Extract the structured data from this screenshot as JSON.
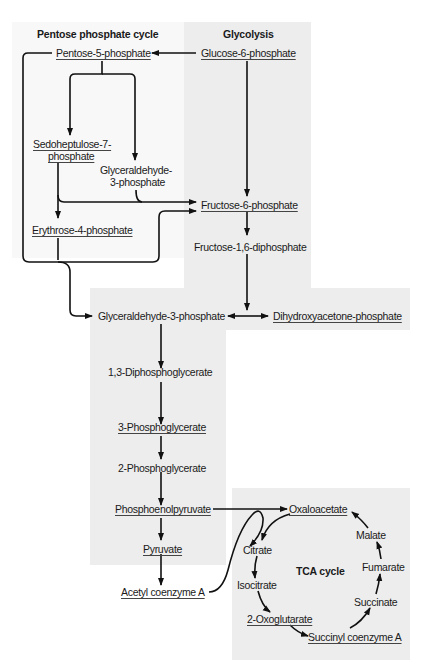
{
  "diagram": {
    "regions": {
      "pentose": {
        "title": "Pentose phosphate cycle",
        "fill": "#f8f8f8"
      },
      "glycolysis": {
        "title": "Glycolysis",
        "fill": "#ededed"
      },
      "tca": {
        "title": "TCA cycle",
        "fill": "#ededed"
      }
    },
    "nodes": {
      "pentose_5_phosphate": "Pentose-5-phosphate",
      "glucose_6_phosphate": "Glucose-6-phosphate",
      "sedoheptulose_7_phosphate_l1": "Sedoheptulose-7-",
      "sedoheptulose_7_phosphate_l2": "phosphate",
      "glyceraldehyde_3_phosphate_pp_l1": "Glyceraldehyde-",
      "glyceraldehyde_3_phosphate_pp_l2": "3-phosphate",
      "fructose_6_phosphate": "Fructose-6-phosphate",
      "erythrose_4_phosphate": "Erythrose-4-phosphate",
      "fructose_1_6_diphosphate": "Fructose-1,6-diphosphate",
      "glyceraldehyde_3_phosphate": "Glyceraldehyde-3-phosphate",
      "dihydroxyacetone_phosphate": "Dihydroxyacetone-phosphate",
      "diphosphoglycerate_1_3": "1,3-Diphosphoglycerate",
      "phosphoglycerate_3": "3-Phosphoglycerate",
      "phosphoglycerate_2": "2-Phosphoglycerate",
      "phosphoenolpyruvate": "Phosphoenolpyruvate",
      "pyruvate": "Pyruvate",
      "acetyl_coenzyme_a": "Acetyl coenzyme A",
      "oxaloacetate": "Oxaloacetate",
      "citrate": "Citrate",
      "isocitrate": "Isocitrate",
      "oxoglutarate_2": "2-Oxoglutarate",
      "succinyl_coenzyme_a": "Succinyl coenzyme A",
      "succinate": "Succinate",
      "fumarate": "Fumarate",
      "malate": "Malate"
    },
    "edges": [
      [
        "Glucose-6-phosphate",
        "Pentose-5-phosphate"
      ],
      [
        "Pentose-5-phosphate",
        "Sedoheptulose-7-phosphate"
      ],
      [
        "Pentose-5-phosphate",
        "Glyceraldehyde-3-phosphate (pentose)"
      ],
      [
        "Sedoheptulose-7-phosphate",
        "Erythrose-4-phosphate"
      ],
      [
        "Sedoheptulose-7-phosphate",
        "Fructose-6-phosphate"
      ],
      [
        "Glyceraldehyde-3-phosphate (pentose)",
        "Fructose-6-phosphate"
      ],
      [
        "Erythrose-4-phosphate",
        "Fructose-6-phosphate"
      ],
      [
        "Pentose-5-phosphate",
        "Glyceraldehyde-3-phosphate"
      ],
      [
        "Erythrose-4-phosphate",
        "Glyceraldehyde-3-phosphate"
      ],
      [
        "Glucose-6-phosphate",
        "Fructose-6-phosphate"
      ],
      [
        "Fructose-6-phosphate",
        "Fructose-1,6-diphosphate"
      ],
      [
        "Fructose-1,6-diphosphate",
        "Glyceraldehyde-3-phosphate"
      ],
      [
        "Fructose-1,6-diphosphate",
        "Dihydroxyacetone-phosphate"
      ],
      [
        "Glyceraldehyde-3-phosphate",
        "1,3-Diphosphoglycerate"
      ],
      [
        "1,3-Diphosphoglycerate",
        "3-Phosphoglycerate"
      ],
      [
        "3-Phosphoglycerate",
        "2-Phosphoglycerate"
      ],
      [
        "2-Phosphoglycerate",
        "Phosphoenolpyruvate"
      ],
      [
        "Phosphoenolpyruvate",
        "Pyruvate"
      ],
      [
        "Phosphoenolpyruvate",
        "Oxaloacetate"
      ],
      [
        "Pyruvate",
        "Acetyl coenzyme A"
      ],
      [
        "Acetyl coenzyme A",
        "Citrate"
      ],
      [
        "Oxaloacetate",
        "Citrate"
      ],
      [
        "Citrate",
        "Isocitrate"
      ],
      [
        "Isocitrate",
        "2-Oxoglutarate"
      ],
      [
        "2-Oxoglutarate",
        "Succinyl coenzyme A"
      ],
      [
        "Succinyl coenzyme A",
        "Succinate"
      ],
      [
        "Succinate",
        "Fumarate"
      ],
      [
        "Fumarate",
        "Malate"
      ],
      [
        "Malate",
        "Oxaloacetate"
      ]
    ]
  }
}
